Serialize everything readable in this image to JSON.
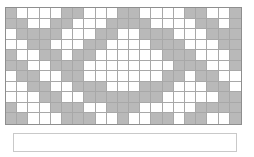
{
  "chart_data": {
    "type": "heatmap",
    "title": "",
    "subtitle": "",
    "xlabel": "",
    "ylabel": "",
    "grid": true,
    "legend": "none",
    "columns": 21,
    "rows": 11,
    "x": [
      1,
      2,
      3,
      4,
      5,
      6,
      7,
      8,
      9,
      10,
      11,
      12,
      13,
      14,
      15,
      16,
      17,
      18,
      19,
      20,
      21
    ],
    "y": [
      1,
      2,
      3,
      4,
      5,
      6,
      7,
      8,
      9,
      10,
      11
    ],
    "filled_color": "#b9b9b9",
    "empty_color": "#ffffff",
    "gridline_color": "#a8a8a8",
    "border_color": "#8e8e8e",
    "value_legend": {
      "0": "empty",
      "1": "filled"
    },
    "matrix": [
      [
        1,
        0,
        0,
        0,
        0,
        1,
        1,
        0,
        0,
        0,
        1,
        1,
        0,
        0,
        0,
        0,
        1,
        1,
        0,
        0,
        1
      ],
      [
        1,
        1,
        0,
        0,
        1,
        1,
        0,
        0,
        0,
        1,
        1,
        1,
        1,
        0,
        0,
        0,
        0,
        1,
        1,
        0,
        1
      ],
      [
        0,
        1,
        1,
        1,
        1,
        0,
        0,
        0,
        1,
        1,
        0,
        0,
        1,
        1,
        1,
        0,
        0,
        0,
        1,
        1,
        1
      ],
      [
        0,
        0,
        1,
        1,
        0,
        0,
        0,
        1,
        1,
        0,
        0,
        0,
        0,
        1,
        1,
        1,
        0,
        0,
        0,
        1,
        1
      ],
      [
        1,
        0,
        0,
        1,
        1,
        0,
        1,
        1,
        0,
        0,
        0,
        0,
        0,
        0,
        1,
        1,
        1,
        0,
        0,
        0,
        1
      ],
      [
        1,
        1,
        0,
        0,
        1,
        1,
        1,
        0,
        0,
        0,
        0,
        0,
        0,
        0,
        0,
        1,
        1,
        1,
        0,
        0,
        1
      ],
      [
        0,
        1,
        1,
        0,
        0,
        1,
        1,
        0,
        0,
        0,
        0,
        0,
        0,
        0,
        1,
        1,
        0,
        1,
        1,
        0,
        0
      ],
      [
        0,
        0,
        1,
        1,
        0,
        0,
        1,
        1,
        1,
        0,
        0,
        0,
        1,
        1,
        1,
        0,
        0,
        0,
        1,
        1,
        0
      ],
      [
        0,
        0,
        0,
        1,
        1,
        0,
        0,
        1,
        1,
        1,
        1,
        1,
        1,
        1,
        0,
        0,
        0,
        0,
        0,
        1,
        1
      ],
      [
        1,
        0,
        0,
        0,
        1,
        1,
        1,
        0,
        0,
        1,
        1,
        1,
        0,
        0,
        0,
        0,
        0,
        1,
        1,
        1,
        1
      ],
      [
        1,
        1,
        0,
        0,
        0,
        1,
        1,
        1,
        0,
        0,
        1,
        0,
        0,
        1,
        1,
        0,
        1,
        1,
        0,
        0,
        1
      ]
    ]
  },
  "notes": {
    "content": ""
  }
}
